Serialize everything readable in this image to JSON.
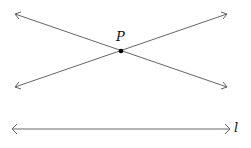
{
  "diagram": {
    "point_label": "P",
    "line_label": "l",
    "line_color": "#666666",
    "point_color": "#000000"
  }
}
